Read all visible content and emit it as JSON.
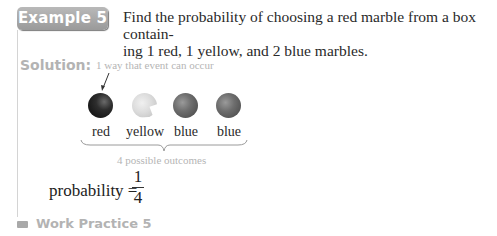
{
  "example": {
    "badge": "Example 5",
    "problem_line1": "Find the probability of choosing a red marble from a box contain-",
    "problem_line2": "ing 1 red, 1 yellow, and 2 blue marbles."
  },
  "solution": {
    "label": "Solution:",
    "annotation": "1 way that event can occur",
    "marbles": [
      {
        "color": "red",
        "label": "red"
      },
      {
        "color": "yellow",
        "label": "yellow"
      },
      {
        "color": "blue",
        "label": "blue"
      },
      {
        "color": "blue",
        "label": "blue"
      }
    ],
    "outcomes_label": "4 possible outcomes",
    "probability": {
      "label": "probability =",
      "numerator": "1",
      "denominator": "4"
    }
  },
  "work_practice": {
    "label": "Work Practice 5"
  }
}
